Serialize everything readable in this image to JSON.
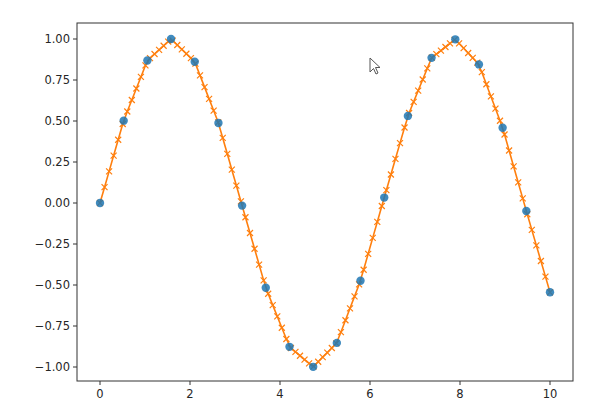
{
  "chart_data": {
    "type": "line",
    "title": "",
    "xlabel": "",
    "ylabel": "",
    "xlim": [
      -0.5,
      10.5
    ],
    "ylim": [
      -1.1,
      1.1
    ],
    "grid": false,
    "legend": null,
    "xticks": [
      0,
      2,
      4,
      6,
      8,
      10
    ],
    "xtick_labels": [
      "0",
      "2",
      "4",
      "6",
      "8",
      "10"
    ],
    "yticks": [
      1.0,
      0.75,
      0.5,
      0.25,
      0.0,
      -0.25,
      -0.5,
      -0.75,
      -1.0
    ],
    "ytick_labels": [
      "1.00",
      "0.75",
      "0.50",
      "0.25",
      "0.00",
      "−0.25",
      "−0.50",
      "−0.75",
      "−1.00"
    ],
    "series": [
      {
        "name": "data",
        "style": "markers",
        "marker": "o",
        "color": "#1f77b4",
        "x": [
          0.0,
          0.526,
          1.053,
          1.579,
          2.105,
          2.632,
          3.158,
          3.684,
          4.211,
          4.737,
          5.263,
          5.789,
          6.316,
          6.842,
          7.368,
          7.895,
          8.421,
          8.947,
          9.474,
          10.0
        ],
        "y": [
          0.0,
          0.502,
          0.869,
          1.0,
          0.861,
          0.488,
          -0.016,
          -0.517,
          -0.877,
          -0.999,
          -0.853,
          -0.474,
          0.033,
          0.531,
          0.885,
          0.998,
          0.845,
          0.459,
          -0.049,
          -0.544
        ]
      },
      {
        "name": "interpolated",
        "style": "line+markers",
        "marker": "x",
        "color": "#ff7f0e",
        "num_points": 100,
        "method": "linear interpolation of data over x in [0, 10]"
      }
    ]
  },
  "ui": {
    "cursor": {
      "x": 369,
      "y": 57
    }
  }
}
